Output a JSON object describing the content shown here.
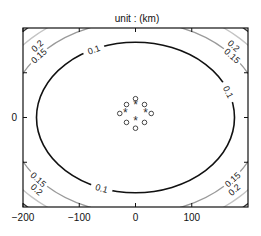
{
  "chart_data": {
    "type": "contour",
    "title": "unit : (km)",
    "xlabel": "",
    "ylabel": "",
    "xlim": [
      -200,
      200
    ],
    "ylim": [
      -200,
      200
    ],
    "x_ticks": [
      -200,
      -100,
      0,
      100
    ],
    "x_tick_labels": [
      "−200",
      "−100",
      "0",
      "100"
    ],
    "y_ticks": [
      -100,
      0,
      100
    ],
    "y_tick_labels": [
      "",
      "0",
      ""
    ],
    "grid": false,
    "contours": [
      {
        "level": 0.1,
        "label": "0.1",
        "color": "#111111",
        "rx_km": 176,
        "ry_km": 168
      },
      {
        "level": 0.15,
        "label": "0.15",
        "color": "#9a9a9a",
        "rx_km": 225,
        "ry_km": 215
      },
      {
        "level": 0.2,
        "label": "0.2",
        "color": "#c4c4c4",
        "rx_km": 262,
        "ry_km": 250
      },
      {
        "level": 0.25,
        "label": "",
        "color": "#333333",
        "rx_km": 283,
        "ry_km": 272
      }
    ],
    "markers": {
      "circles": {
        "symbol": "o",
        "points": [
          [
            0,
            42
          ],
          [
            -16,
            29
          ],
          [
            16,
            29
          ],
          [
            -28,
            9
          ],
          [
            28,
            9
          ],
          [
            -16,
            -11
          ],
          [
            16,
            -11
          ],
          [
            0,
            -24
          ]
        ]
      },
      "stars": {
        "symbol": "*",
        "points": [
          [
            0,
            29
          ],
          [
            -18,
            11
          ],
          [
            18,
            11
          ],
          [
            0,
            -7
          ]
        ]
      }
    }
  }
}
